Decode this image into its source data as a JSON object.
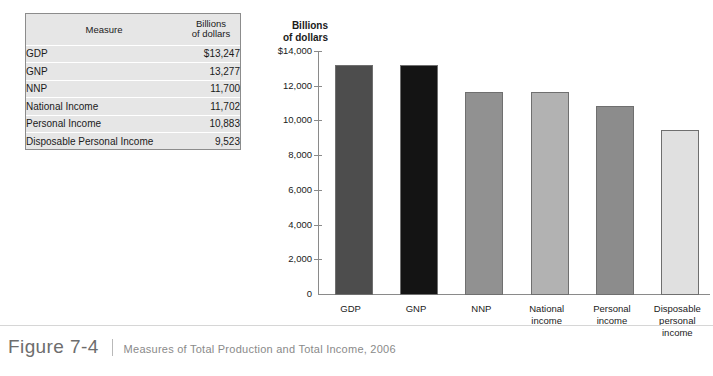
{
  "table": {
    "headers": [
      "Measure",
      "Billions|of dollars"
    ],
    "header_measure": "Measure",
    "header_value_line1": "Billions",
    "header_value_line2": "of dollars",
    "rows": [
      {
        "measure": "GDP",
        "value": "$13,247"
      },
      {
        "measure": "GNP",
        "value": "13,277"
      },
      {
        "measure": "NNP",
        "value": "11,700"
      },
      {
        "measure": "National Income",
        "value": "11,702"
      },
      {
        "measure": "Personal Income",
        "value": "10,883"
      },
      {
        "measure": "Disposable Personal Income",
        "value": "9,523"
      }
    ]
  },
  "chart": {
    "axis_title_line1": "Billions",
    "axis_title_line2": "of dollars"
  },
  "chart_data": {
    "type": "bar",
    "title": "Measures of Total Production and Total Income, 2006",
    "xlabel": "",
    "ylabel": "Billions of dollars",
    "ylim": [
      0,
      14000
    ],
    "ytick_labels": [
      "$14,000",
      "12,000",
      "10,000",
      "8,000",
      "6,000",
      "4,000",
      "2,000",
      "0"
    ],
    "ytick_values": [
      14000,
      12000,
      10000,
      8000,
      6000,
      4000,
      2000,
      0
    ],
    "grid": false,
    "legend": "none",
    "categories": [
      "GDP",
      "GNP",
      "NNP",
      "National income",
      "Personal income",
      "Disposable personal income"
    ],
    "category_lines": [
      [
        "GDP"
      ],
      [
        "GNP"
      ],
      [
        "NNP"
      ],
      [
        "National",
        "income"
      ],
      [
        "Personal",
        "income"
      ],
      [
        "Disposable",
        "personal",
        "income"
      ]
    ],
    "values": [
      13247,
      13277,
      11700,
      11702,
      10883,
      9523
    ],
    "bar_colors": [
      "#4d4d4d",
      "#141414",
      "#919191",
      "#b2b2b2",
      "#8c8c8c",
      "#e0e0e0"
    ]
  },
  "caption": {
    "figure_number": "Figure 7-4",
    "text": "Measures of Total Production and Total Income, 2006"
  }
}
